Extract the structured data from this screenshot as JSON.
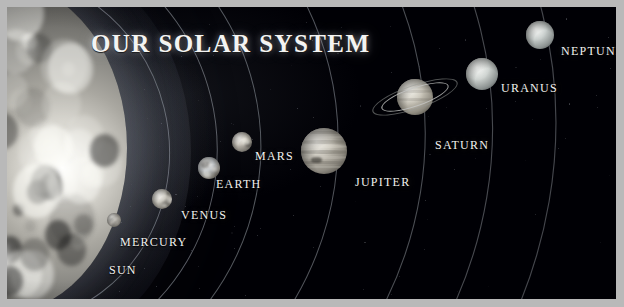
{
  "poster": {
    "title": "OUR SOLAR SYSTEM",
    "frame_color": "#b9b9b9",
    "background_color": "#000005",
    "label_color": "#f2f2f0",
    "orbit_color": "#9aa0a8",
    "width": 624,
    "height": 307
  },
  "sun": {
    "label": "SUN",
    "label_x": 102,
    "label_y": 256
  },
  "planets": [
    {
      "name": "MERCURY",
      "label": "MERCURY",
      "cx": 107,
      "cy": 213,
      "r": 7,
      "label_x": 113,
      "label_y": 228,
      "tint": "#b8b5ae",
      "type": "rocky"
    },
    {
      "name": "VENUS",
      "label": "VENUS",
      "cx": 155,
      "cy": 192,
      "r": 10,
      "label_x": 174,
      "label_y": 201,
      "tint": "#c9c6bd",
      "type": "rocky"
    },
    {
      "name": "EARTH",
      "label": "EARTH",
      "cx": 202,
      "cy": 161,
      "r": 11,
      "label_x": 209,
      "label_y": 170,
      "tint": "#bfc3c6",
      "type": "rocky"
    },
    {
      "name": "MARS",
      "label": "MARS",
      "cx": 235,
      "cy": 135,
      "r": 10,
      "label_x": 248,
      "label_y": 142,
      "tint": "#c2bdb3",
      "type": "rocky"
    },
    {
      "name": "JUPITER",
      "label": "JUPITER",
      "cx": 317,
      "cy": 144,
      "r": 23,
      "label_x": 348,
      "label_y": 168,
      "tint": "#c5c1b6",
      "type": "banded"
    },
    {
      "name": "SATURN",
      "label": "SATURN",
      "cx": 408,
      "cy": 90,
      "r": 18,
      "label_x": 428,
      "label_y": 131,
      "tint": "#cac6ba",
      "type": "ringed"
    },
    {
      "name": "URANUS",
      "label": "URANUS",
      "cx": 475,
      "cy": 67,
      "r": 16,
      "label_x": 494,
      "label_y": 74,
      "tint": "#cdd2cf",
      "type": "ice"
    },
    {
      "name": "NEPTUNE",
      "label": "NEPTUNE",
      "cx": 533,
      "cy": 28,
      "r": 14,
      "label_x": 554,
      "label_y": 37,
      "tint": "#c6ccca",
      "type": "ice"
    }
  ],
  "orbits": [
    {
      "for": "MERCURY",
      "rx": 118,
      "ry": 132
    },
    {
      "for": "VENUS",
      "rx": 166,
      "ry": 176
    },
    {
      "for": "EARTH",
      "rx": 214,
      "ry": 218
    },
    {
      "for": "MARS",
      "rx": 258,
      "ry": 256
    },
    {
      "for": "JUPITER",
      "rx": 336,
      "ry": 320
    },
    {
      "for": "SATURN",
      "rx": 424,
      "ry": 392
    },
    {
      "for": "URANUS",
      "rx": 492,
      "ry": 448
    },
    {
      "for": "NEPTUNE",
      "rx": 556,
      "ry": 500
    }
  ]
}
